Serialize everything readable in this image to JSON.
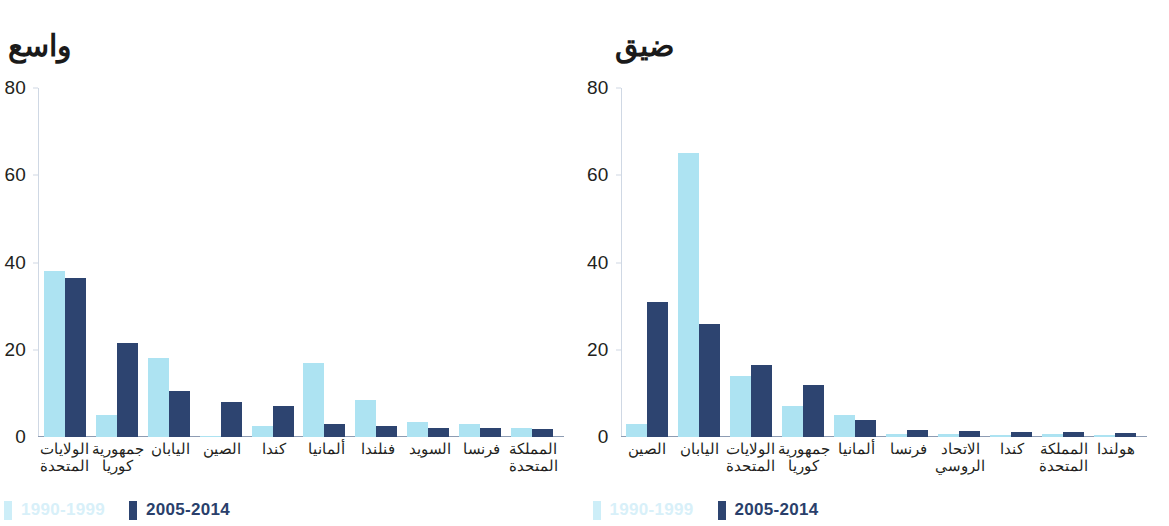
{
  "figure": {
    "background": "#ffffff",
    "colors": {
      "series_1990_1999": "#ade3f2",
      "series_2005_2014": "#2d4470",
      "axis": "#8d9cb3",
      "text": "#231f20"
    }
  },
  "legend": {
    "items": [
      {
        "label": "1990-1999",
        "color": "#cdeef8"
      },
      {
        "label": "2005-2014",
        "color": "#2d4470"
      }
    ]
  },
  "chart_data": [
    {
      "type": "bar",
      "id": "wide",
      "title": "واسع",
      "xlabel": "",
      "ylabel": "",
      "ylim": [
        0,
        80
      ],
      "yticks": [
        0,
        20,
        40,
        60,
        80
      ],
      "grid": false,
      "legend_position": "bottom-left",
      "categories": [
        "الولايات المتحدة",
        "جمهورية كوريا",
        "اليابان",
        "الصين",
        "كندا",
        "ألمانيا",
        "فنلندا",
        "السويد",
        "فرنسا",
        "المملكة المتحدة"
      ],
      "series": [
        {
          "name": "1990-1999",
          "color": "#ade3f2",
          "values": [
            38,
            5,
            18,
            0.3,
            2.5,
            17,
            8.5,
            3.5,
            3,
            2
          ]
        },
        {
          "name": "2005-2014",
          "color": "#2d4470",
          "values": [
            36.5,
            21.5,
            10.5,
            8,
            7,
            3,
            2.5,
            2,
            2,
            1.8
          ]
        }
      ]
    },
    {
      "type": "bar",
      "id": "narrow",
      "title": "ضيق",
      "xlabel": "",
      "ylabel": "",
      "ylim": [
        0,
        80
      ],
      "yticks": [
        0,
        20,
        40,
        60,
        80
      ],
      "grid": false,
      "legend_position": "bottom-left",
      "categories": [
        "الصين",
        "اليابان",
        "الولايات المتحدة",
        "جمهورية كوريا",
        "ألمانيا",
        "فرنسا",
        "الاتحاد الروسي",
        "كندا",
        "المملكة المتحدة",
        "هولندا"
      ],
      "series": [
        {
          "name": "1990-1999",
          "color": "#ade3f2",
          "values": [
            3,
            65,
            14,
            7,
            5,
            0.6,
            0.8,
            0.5,
            0.6,
            0.4
          ]
        },
        {
          "name": "2005-2014",
          "color": "#2d4470",
          "values": [
            31,
            26,
            16.5,
            12,
            4,
            1.5,
            1.4,
            1.2,
            1.1,
            1
          ]
        }
      ]
    }
  ]
}
